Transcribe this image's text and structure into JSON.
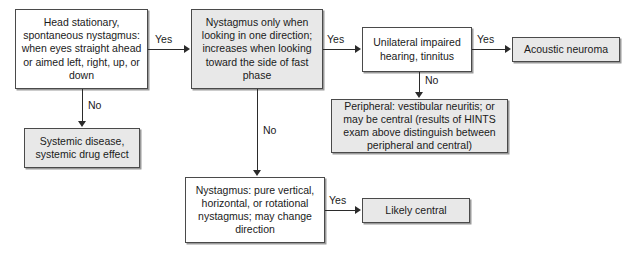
{
  "diagram": {
    "colors": {
      "box_white": "#ffffff",
      "box_gray": "#e8e8e8",
      "border": "#4a4a4a",
      "shadow": "#9a9a9a",
      "line": "#2b2b2b",
      "text": "#1a1a1a"
    },
    "nodes": [
      {
        "id": "head-stationary",
        "text": "Head stationary, spontaneous nystagmus: when eyes straight ahead or aimed left, right, up, or down",
        "fill": "white"
      },
      {
        "id": "systemic-disease",
        "text": "Systemic disease, systemic drug effect",
        "fill": "gray"
      },
      {
        "id": "nystagmus-one-direction",
        "text": "Nystagmus only when looking in one direction; increases when looking toward the side of fast phase",
        "fill": "gray"
      },
      {
        "id": "unilateral-hearing",
        "text": "Unilateral impaired hearing, tinnitus",
        "fill": "white"
      },
      {
        "id": "acoustic-neuroma",
        "text": "Acoustic neuroma",
        "fill": "gray"
      },
      {
        "id": "peripheral-vestibular",
        "text": "Peripheral: vestibular neuritis; or may be central (results of HINTS exam above distinguish between peripheral and central)",
        "fill": "gray"
      },
      {
        "id": "nystagmus-pure-vertical",
        "text": "Nystagmus: pure vertical, horizontal, or rotational nystagmus; may change direction",
        "fill": "white"
      },
      {
        "id": "likely-central",
        "text": "Likely central",
        "fill": "gray"
      }
    ],
    "edge_labels": {
      "head_to_nystagmus": "Yes",
      "head_to_systemic": "No",
      "nystagmus_to_unilateral": "Yes",
      "nystagmus_to_pure_vertical": "No",
      "unilateral_to_acoustic": "Yes",
      "unilateral_to_peripheral": "No",
      "pure_vertical_to_likely_central": "Yes"
    }
  }
}
